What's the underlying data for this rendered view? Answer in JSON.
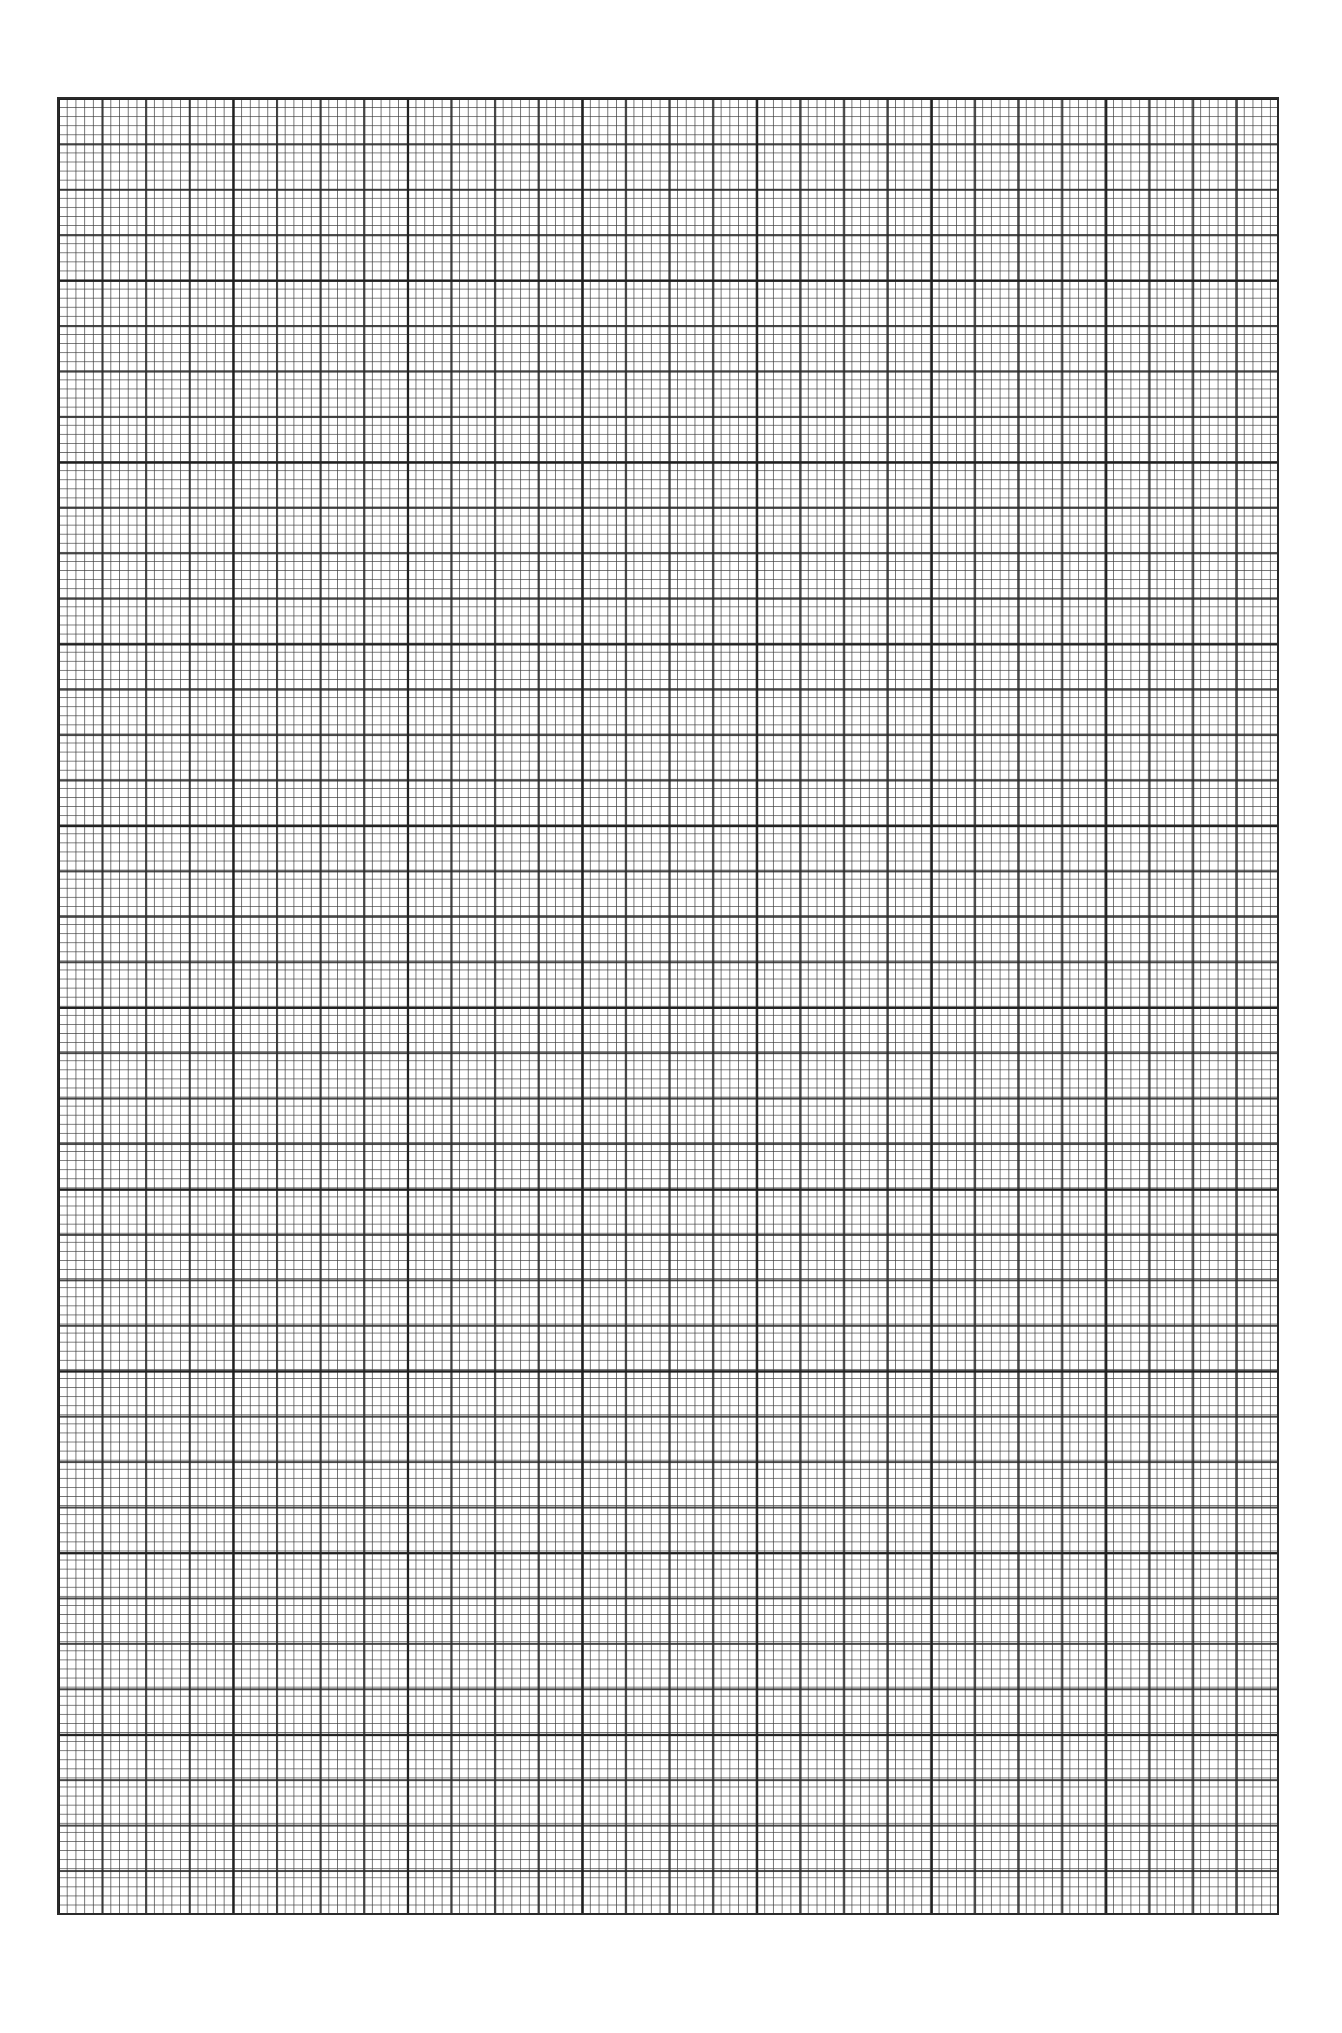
{
  "page": {
    "type": "graph-paper"
  },
  "grid": {
    "major_columns": 7,
    "major_rows": 10,
    "medium_divisions_per_major": 4,
    "minor_divisions_per_medium": 5,
    "minor_columns_total": 140,
    "minor_rows_total": 200,
    "line_color": "#2a2a2a",
    "background_color": "#ffffff"
  },
  "content": {
    "label": ""
  }
}
